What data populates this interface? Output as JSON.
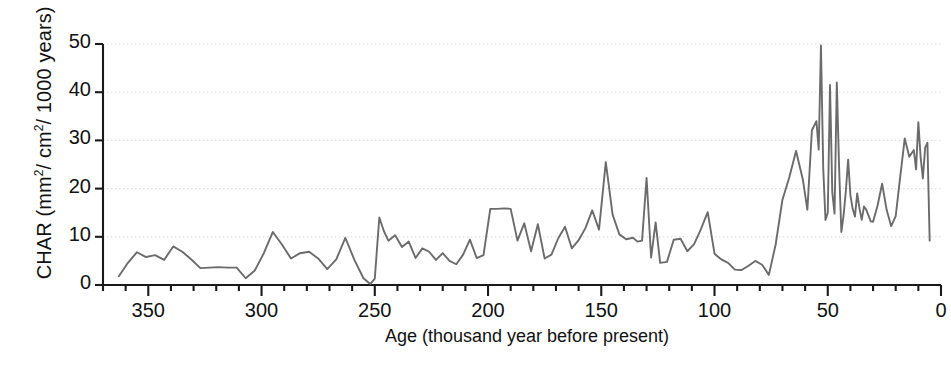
{
  "chart_data": {
    "type": "line",
    "title": "",
    "xlabel": "Age (thousand year before present)",
    "ylabel": "CHAR (mm2/ cm2/ 1000 years)",
    "ylabel_parts": {
      "pre": "CHAR (mm",
      "sup1": "2",
      "mid": "/ cm",
      "sup2": "2",
      "post": "/ 1000 years)"
    },
    "xlim": [
      370,
      0
    ],
    "ylim": [
      0,
      50
    ],
    "x_reversed": true,
    "grid": "horizontal-dotted",
    "legend": "none",
    "line_color": "#6b6b6b",
    "axis_color": "#1a1a1a",
    "grid_color": "#d8d8d8",
    "xticks_major": [
      350,
      300,
      250,
      200,
      150,
      100,
      50,
      0
    ],
    "xtick_labels": [
      "350",
      "300",
      "250",
      "200",
      "150",
      "100",
      "50",
      "0"
    ],
    "xticks_minor_step": 10,
    "yticks": [
      0,
      10,
      20,
      30,
      40,
      50
    ],
    "ytick_labels": [
      "0",
      "10",
      "20",
      "30",
      "40",
      "50"
    ],
    "series_name": "CHAR",
    "x": [
      363,
      359,
      355,
      351,
      347,
      343,
      339,
      335,
      331,
      327,
      323,
      319,
      315,
      311,
      307,
      303,
      299,
      295,
      291,
      287,
      283,
      279,
      275,
      271,
      267,
      263,
      259,
      255,
      252,
      250,
      248,
      246,
      244,
      241,
      238,
      235,
      232,
      229,
      226,
      223,
      220,
      217,
      214,
      211,
      208,
      205,
      202,
      199,
      196,
      193,
      190,
      187,
      184,
      181,
      178,
      175,
      172,
      169,
      166,
      163,
      160,
      157,
      154,
      151,
      148,
      145,
      142,
      139,
      136,
      134,
      132,
      130,
      128,
      126,
      124,
      121,
      118,
      115,
      112,
      109,
      106,
      103,
      100,
      97,
      94,
      91,
      88,
      85,
      82,
      79,
      76,
      73,
      70,
      67,
      64,
      61,
      59,
      57,
      55,
      54,
      53,
      52,
      51,
      50,
      49,
      48,
      47,
      46,
      45,
      44,
      43,
      42,
      41,
      40,
      39,
      38,
      37,
      36,
      35,
      34,
      33,
      32,
      31,
      30,
      28,
      26,
      24,
      22,
      20,
      18,
      16,
      14,
      12,
      11,
      10,
      9,
      8,
      7,
      6,
      5,
      4,
      3,
      2
    ],
    "y": [
      1.8,
      4.6,
      6.8,
      5.8,
      6.2,
      5.2,
      8.0,
      6.9,
      5.3,
      3.5,
      3.6,
      3.7,
      3.6,
      3.6,
      1.4,
      3.0,
      6.6,
      11.0,
      8.4,
      5.5,
      6.6,
      6.9,
      5.5,
      3.3,
      5.3,
      9.8,
      5.2,
      1.4,
      0.2,
      1.3,
      14.0,
      11.2,
      9.2,
      10.3,
      7.9,
      9.0,
      5.6,
      7.6,
      6.9,
      5.2,
      6.6,
      5.0,
      4.3,
      6.3,
      9.4,
      5.6,
      6.2,
      15.8,
      15.8,
      15.9,
      15.8,
      9.2,
      12.8,
      7.0,
      12.6,
      5.5,
      6.3,
      9.7,
      12.1,
      7.6,
      9.3,
      11.8,
      15.5,
      11.5,
      25.5,
      14.6,
      10.5,
      9.5,
      9.8,
      9.0,
      9.2,
      22.2,
      5.7,
      13.0,
      4.6,
      4.8,
      9.4,
      9.6,
      7.0,
      8.5,
      11.6,
      15.1,
      6.5,
      5.3,
      4.6,
      3.2,
      3.1,
      4.0,
      5.0,
      4.2,
      2.1,
      8.4,
      17.7,
      22.3,
      27.8,
      21.9,
      15.6,
      32.1,
      34.0,
      28.1,
      49.7,
      24.2,
      13.5,
      15.0,
      41.5,
      19.2,
      14.8,
      42.0,
      24.5,
      11.0,
      14.5,
      19.6,
      26.0,
      18.6,
      15.8,
      14.2,
      19.0,
      15.9,
      13.5,
      16.3,
      15.6,
      14.4,
      13.2,
      13.1,
      16.5,
      21.0,
      15.6,
      12.2,
      14.3,
      22.5,
      30.4,
      26.6,
      28.0,
      24.0,
      33.8,
      26.5,
      22.1,
      28.5,
      29.5,
      9.2
    ]
  }
}
